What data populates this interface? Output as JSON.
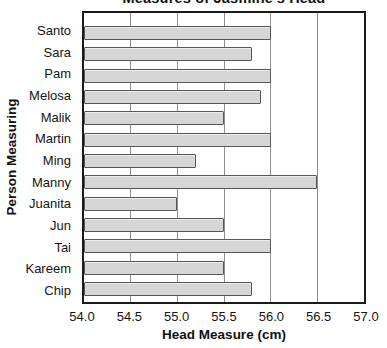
{
  "title": "Measures of Jasmine's Head",
  "chart_data": {
    "type": "bar",
    "orientation": "horizontal",
    "title": "Measures of Jasmine's Head",
    "xlabel": "Head Measure (cm)",
    "ylabel": "Person Measuring",
    "categories": [
      "Santo",
      "Sara",
      "Pam",
      "Melosa",
      "Malik",
      "Martin",
      "Ming",
      "Manny",
      "Juanita",
      "Jun",
      "Tai",
      "Kareem",
      "Chip"
    ],
    "values": [
      56.0,
      55.8,
      56.0,
      55.9,
      55.5,
      56.0,
      55.2,
      56.5,
      55.0,
      55.5,
      56.0,
      55.5,
      55.8
    ],
    "xlim": [
      54.0,
      57.0
    ],
    "xticks": [
      54.0,
      54.5,
      55.0,
      55.5,
      56.0,
      56.5,
      57.0
    ],
    "xtick_labels": [
      "54.0",
      "54.5",
      "55.0",
      "55.5",
      "56.0",
      "56.5",
      "57.0"
    ],
    "grid": true,
    "legend": "none",
    "colors": {
      "bar_fill": "#d6d6d6",
      "bar_border": "#565656",
      "gridline": "#8f8f8f",
      "plot_border": "#1a1a1a",
      "text": "#141414",
      "background": "#ffffff"
    }
  }
}
